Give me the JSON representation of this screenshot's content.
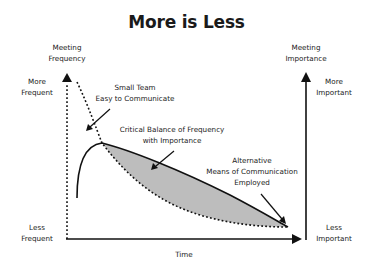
{
  "title": "More is Less",
  "left_axis": {
    "title_line1": "Meeting",
    "title_line2": "Frequency",
    "top_line1": "More",
    "top_line2": "Frequent",
    "bottom_line1": "Less",
    "bottom_line2": "Frequent"
  },
  "right_axis": {
    "title_line1": "Meeting",
    "title_line2": "Importance",
    "top_line1": "More",
    "top_line2": "Important",
    "bottom_line1": "Less",
    "bottom_line2": "Important"
  },
  "x_axis": {
    "label": "Time"
  },
  "annotations": {
    "small_team_line1": "Small Team",
    "small_team_line2": "Easy to Communicate",
    "critical_line1": "Critical Balance of Frequency",
    "critical_line2": "with Importance",
    "alternative_line1": "Alternative",
    "alternative_line2": "Means of Communication",
    "alternative_line3": "Employed"
  },
  "series": [
    {
      "name": "Meeting Frequency",
      "style": "dotted",
      "trend": "decreasing from high to low, flattening over time"
    },
    {
      "name": "Meeting Importance",
      "style": "solid",
      "trend": "rises sharply to a peak then declines steadily"
    }
  ],
  "colors": {
    "line": "#111111",
    "shaded_area": "#bdbdbd"
  }
}
